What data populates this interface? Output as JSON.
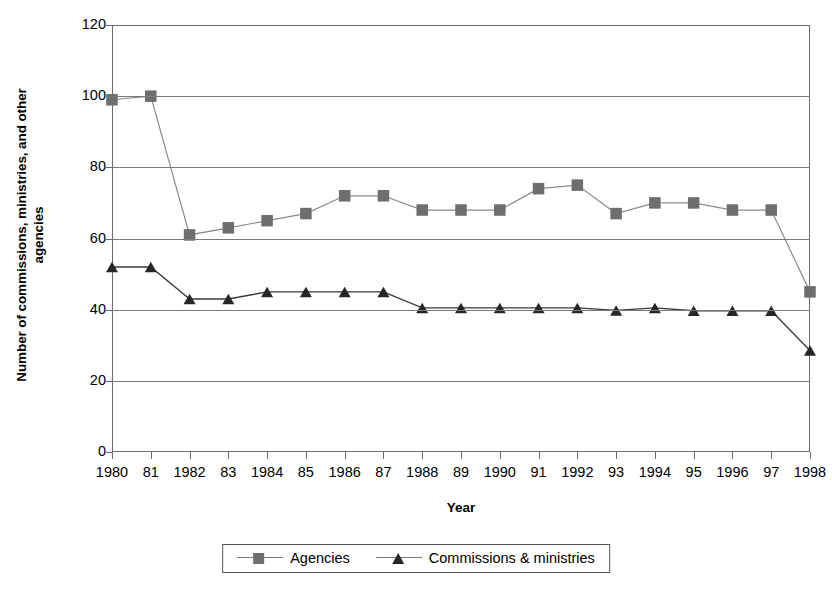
{
  "chart_data": {
    "type": "line",
    "title": "",
    "xlabel": "Year",
    "ylabel": "Number of commissions, ministries, and other agencies",
    "ylabel_line1": "Number of commissions, ministries, and other",
    "ylabel_line2": "agencies",
    "categories": [
      "1980",
      "81",
      "1982",
      "83",
      "1984",
      "85",
      "1986",
      "87",
      "1988",
      "89",
      "1990",
      "91",
      "1992",
      "93",
      "1994",
      "95",
      "1996",
      "97",
      "1998"
    ],
    "x_values": [
      1980,
      1981,
      1982,
      1983,
      1984,
      1985,
      1986,
      1987,
      1988,
      1989,
      1990,
      1991,
      1992,
      1993,
      1994,
      1995,
      1996,
      1997,
      1998
    ],
    "ylim": [
      0,
      120
    ],
    "yticks": [
      0,
      20,
      40,
      60,
      80,
      100,
      120
    ],
    "grid": "horizontal",
    "legend_position": "bottom",
    "series": [
      {
        "name": "Agencies",
        "marker": "square",
        "color": "#6e6e6e",
        "line_color": "#8a8a8a",
        "values": [
          99,
          100,
          61,
          63,
          65,
          67,
          72,
          72,
          68,
          68,
          68,
          74,
          75,
          67,
          70,
          70,
          68,
          68,
          45
        ]
      },
      {
        "name": "Commissions & ministries",
        "marker": "triangle",
        "color": "#262626",
        "line_color": "#3a3a3a",
        "values": [
          52,
          52,
          43,
          43,
          45,
          45,
          45,
          45,
          40.5,
          40.5,
          40.5,
          40.5,
          40.5,
          39.8,
          40.5,
          39.7,
          39.7,
          39.7,
          28.5
        ]
      }
    ]
  },
  "legend": {
    "items": [
      {
        "label": "Agencies",
        "marker": "square"
      },
      {
        "label": "Commissions & ministries",
        "marker": "triangle"
      }
    ]
  },
  "colors": {
    "agencies": "#6e6e6e",
    "commissions": "#262626",
    "grid": "#7a7a7a",
    "axis": "#6a6a6a"
  }
}
